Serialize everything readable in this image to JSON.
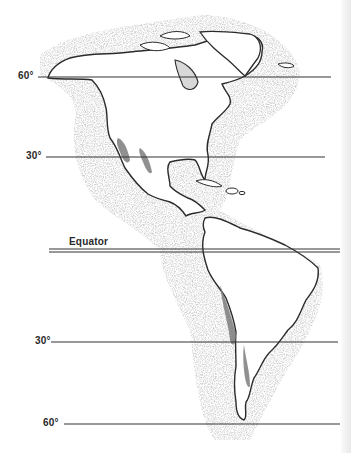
{
  "map": {
    "title": "Americas latitude map with desert regions",
    "colors": {
      "land": "#ffffff",
      "coast": "#2b2b2b",
      "stipple": "#9a9a9a",
      "desert": "#7d7d7d",
      "line": "#333333"
    },
    "latitude_lines": [
      {
        "id": "lat-60n",
        "label": "60°",
        "y": 77,
        "x_start": 38,
        "x_end": 331
      },
      {
        "id": "lat-30n",
        "label": "30°",
        "y": 157,
        "x_start": 46,
        "x_end": 325
      },
      {
        "id": "equator",
        "label": "Equator",
        "y": 250,
        "x_start": 49,
        "x_end": 340,
        "double": true
      },
      {
        "id": "lat-30s",
        "label": "30°",
        "y": 342,
        "x_start": 51,
        "x_end": 338
      },
      {
        "id": "lat-60s",
        "label": "60°",
        "y": 424,
        "x_start": 64,
        "x_end": 340
      }
    ]
  }
}
